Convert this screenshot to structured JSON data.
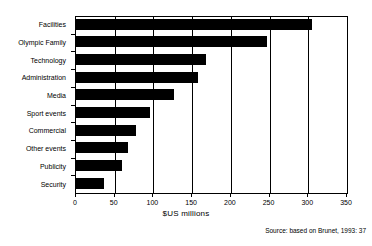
{
  "chart_data": {
    "type": "bar",
    "orientation": "horizontal",
    "title": "",
    "categories": [
      "Facilities",
      "Olympic Family",
      "Technology",
      "Administration",
      "Media",
      "Sport events",
      "Commercial",
      "Other events",
      "Publicity",
      "Security"
    ],
    "values": [
      305,
      247,
      168,
      158,
      126,
      96,
      78,
      67,
      60,
      36
    ],
    "xlabel": "$US millions",
    "ylabel": "",
    "xlim": [
      0,
      350
    ],
    "xticks": [
      0,
      50,
      100,
      150,
      200,
      250,
      300,
      350
    ],
    "xtick_labels": [
      "0",
      "50",
      "100",
      "150",
      "200",
      "250",
      "300",
      "350"
    ],
    "grid": "vertical gridlines at each x tick",
    "legend": "none",
    "bar_color": "#000000",
    "background_color": "#ffffff",
    "annotations": [
      "Source: based on Brunet, 1993: 37"
    ]
  },
  "footer": {
    "source": "Source: based on Brunet, 1993: 37"
  }
}
